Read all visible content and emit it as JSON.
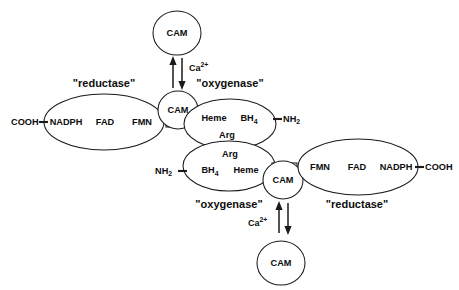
{
  "diagram": {
    "stroke_color": "#1a1a1a",
    "text_color": "#0d0d0d",
    "background_color": "#ffffff",
    "monomers": [
      {
        "id": "upper-monomer",
        "reductase_label": "\"reductase\"",
        "oxygenase_label": "\"oxygenase\"",
        "terminus_c": "COOH",
        "terminus_n_base": "NH",
        "terminus_n_sub": "2",
        "reductase_cofactors": [
          "NADPH",
          "FAD",
          "FMN"
        ],
        "oxygenase_cofactors": [
          "Heme",
          "BH",
          "Arg"
        ],
        "bh4_base": "BH",
        "bh4_sub": "4",
        "arg_label": "Arg",
        "heme_label": "Heme",
        "cam_bound_label": "CAM",
        "cam_free_label": "CAM",
        "ion_base": "Ca",
        "ion_sup": "2+"
      },
      {
        "id": "lower-monomer",
        "reductase_label": "\"reductase\"",
        "oxygenase_label": "\"oxygenase\"",
        "terminus_c": "COOH",
        "terminus_n_base": "NH",
        "terminus_n_sub": "2",
        "reductase_cofactors": [
          "FMN",
          "FAD",
          "NADPH"
        ],
        "oxygenase_cofactors": [
          "BH",
          "Heme",
          "Arg"
        ],
        "bh4_base": "BH",
        "bh4_sub": "4",
        "arg_label": "Arg",
        "heme_label": "Heme",
        "cam_bound_label": "CAM",
        "cam_free_label": "CAM",
        "ion_base": "Ca",
        "ion_sup": "2+"
      }
    ]
  }
}
